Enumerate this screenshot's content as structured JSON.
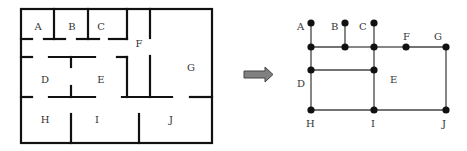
{
  "floorplan": {
    "rooms": [
      {
        "id": "A",
        "label": "A",
        "x": 38,
        "y": 30
      },
      {
        "id": "B",
        "label": "B",
        "x": 72,
        "y": 30
      },
      {
        "id": "C",
        "label": "C",
        "x": 101,
        "y": 30
      },
      {
        "id": "F",
        "label": "F",
        "x": 139,
        "y": 47
      },
      {
        "id": "G",
        "label": "G",
        "x": 191,
        "y": 71
      },
      {
        "id": "D",
        "label": "D",
        "x": 45,
        "y": 83
      },
      {
        "id": "E",
        "label": "E",
        "x": 101,
        "y": 83
      },
      {
        "id": "H",
        "label": "H",
        "x": 45,
        "y": 123
      },
      {
        "id": "I",
        "label": "I",
        "x": 97,
        "y": 123
      },
      {
        "id": "J",
        "label": "J",
        "x": 171,
        "y": 123
      }
    ]
  },
  "arrow": {
    "direction": "right",
    "color": "#7a7a7a"
  },
  "graph": {
    "nodes": [
      {
        "id": "A",
        "label": "A",
        "x": 311,
        "y": 23,
        "lx": 297,
        "ly": 30
      },
      {
        "id": "B",
        "label": "B",
        "x": 345,
        "y": 23,
        "lx": 331,
        "ly": 30
      },
      {
        "id": "C",
        "label": "C",
        "x": 374,
        "y": 23,
        "lx": 359,
        "ly": 30
      },
      {
        "id": "n1",
        "label": "",
        "x": 311,
        "y": 47
      },
      {
        "id": "n2",
        "label": "",
        "x": 345,
        "y": 47
      },
      {
        "id": "n3",
        "label": "",
        "x": 374,
        "y": 47
      },
      {
        "id": "F",
        "label": "F",
        "x": 406,
        "y": 47,
        "lx": 403,
        "ly": 40
      },
      {
        "id": "G",
        "label": "G",
        "x": 446,
        "y": 47,
        "lx": 434,
        "ly": 40
      },
      {
        "id": "D",
        "label": "D",
        "x": 311,
        "y": 70,
        "lx": 297,
        "ly": 87
      },
      {
        "id": "E",
        "label": "E",
        "x": 374,
        "y": 70,
        "lx": 390,
        "ly": 83
      },
      {
        "id": "H",
        "label": "H",
        "x": 311,
        "y": 110,
        "lx": 306,
        "ly": 127
      },
      {
        "id": "I",
        "label": "I",
        "x": 374,
        "y": 110,
        "lx": 371,
        "ly": 127
      },
      {
        "id": "J",
        "label": "J",
        "x": 446,
        "y": 110,
        "lx": 442,
        "ly": 127
      }
    ],
    "edges": [
      [
        "A",
        "n1"
      ],
      [
        "B",
        "n2"
      ],
      [
        "C",
        "n3"
      ],
      [
        "n1",
        "n2"
      ],
      [
        "n2",
        "n3"
      ],
      [
        "n3",
        "F"
      ],
      [
        "F",
        "G"
      ],
      [
        "n1",
        "D"
      ],
      [
        "D",
        "H"
      ],
      [
        "D",
        "E"
      ],
      [
        "n3",
        "E"
      ],
      [
        "E",
        "I"
      ],
      [
        "H",
        "I"
      ],
      [
        "I",
        "J"
      ],
      [
        "G",
        "J"
      ]
    ]
  }
}
